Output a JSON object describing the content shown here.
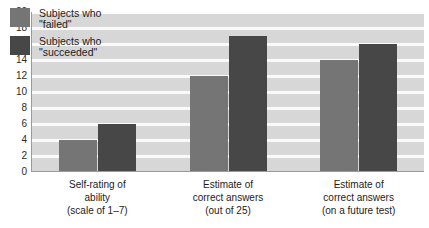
{
  "chart_data": {
    "type": "bar",
    "title": "",
    "xlabel": "",
    "ylabel": "",
    "ylim": [
      0,
      20
    ],
    "ytick_step": 2,
    "yticks": [
      "20",
      "18",
      "16",
      "14",
      "12",
      "10",
      "8",
      "6",
      "4",
      "2",
      "0"
    ],
    "grid": true,
    "grid_color": "#fbfbfb",
    "plot_background": "#d7d7d7",
    "legend_position": "top-left",
    "categories": [
      "Self-rating of\nability\n(scale of 1–7)",
      "Estimate of\ncorrect answers\n(out of 25)",
      "Estimate of\ncorrect answers\n(on a future test)"
    ],
    "series": [
      {
        "name": "Subjects who\n\"failed\"",
        "color": "#757575",
        "values": [
          4,
          12,
          14
        ]
      },
      {
        "name": "Subjects who\n\"succeeded\"",
        "color": "#474747",
        "values": [
          6,
          17,
          16
        ]
      }
    ]
  },
  "legend": {
    "items": [
      {
        "label": "Subjects who\n\"failed\"",
        "color": "#757575"
      },
      {
        "label": "Subjects who\n\"succeeded\"",
        "color": "#474747"
      }
    ]
  }
}
